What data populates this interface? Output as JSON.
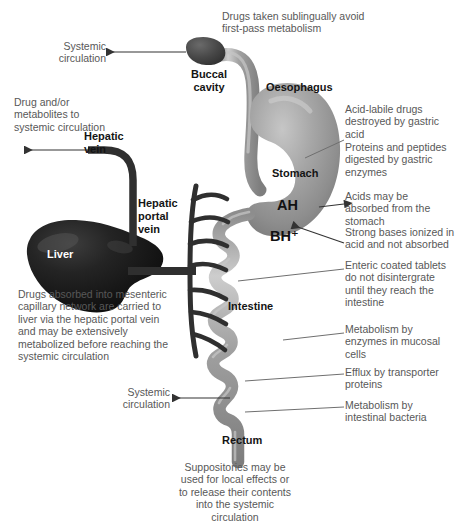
{
  "diagram": {
    "colors": {
      "gi_tract": "#9b9b9b",
      "gi_tract_light": "#c9c9c9",
      "gi_tract_dark": "#7b7b7b",
      "buccal_cavity": "#4e4e4e",
      "liver": "#1c1c1c",
      "vessel": "#333333",
      "annotation_text": "#585858",
      "organ_text": "#141414",
      "leader_line": "#6f6f6f",
      "background": "#ffffff"
    }
  },
  "organs": {
    "buccal_cavity": "Buccal\ncavity",
    "oesophagus": "Oesophagus",
    "stomach": "Stomach",
    "intestine": "Intestine",
    "rectum": "Rectum",
    "liver": "Liver",
    "hepatic_vein": "Hepatic\nvein",
    "hepatic_portal_vein": "Hepatic\nportal\nvein"
  },
  "chemistry": {
    "neutral_acid": "AH",
    "protonated_base": "BH⁺"
  },
  "annotations": {
    "sublingual": "Drugs taken sublingually avoid\nfirst-pass metabolism",
    "systemic_circulation_top": "Systemic\ncirculation",
    "drug_metabolites": "Drug and/or\nmetabolites to\nsystemic circulation",
    "gastric_acid": "Acid-labile drugs\ndestroyed by gastric\nacid",
    "gastric_enzymes": "Proteins and peptides\ndigested by gastric\nenzymes",
    "acids_absorbed": "Acids may be\nabsorbed from the\nstomach",
    "strong_bases": "Strong bases ionized in\nacid and not absorbed",
    "enteric_coated": "Enteric coated tablets\ndo not disintergrate\nuntil they reach the\nintestine",
    "mucosal_metabolism": "Metabolism by\nenzymes in mucosal\ncells",
    "efflux": "Efflux by transporter\nproteins",
    "bacterial_metabolism": "Metabolism by\nintestinal bacteria",
    "mesenteric": "Drugs absorbed into mesenteric\ncapillary network are carried to\nliver via the hepatic portal vein\nand may be extensively\nmetabolized before reaching the\nsystemic circulation",
    "systemic_circulation_rectal": "Systemic\ncirculation",
    "suppositories": "Suppositories may be\nused for local effects or\nto release their contents\ninto the systemic\ncirculation"
  }
}
